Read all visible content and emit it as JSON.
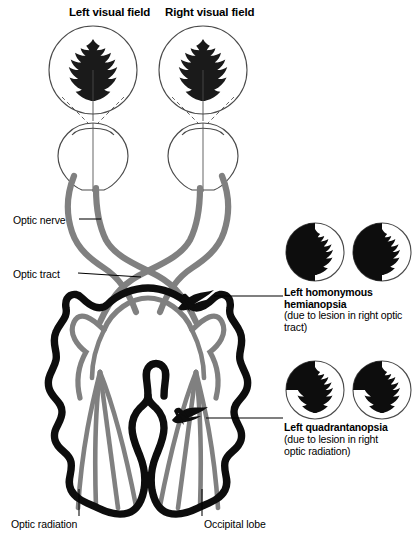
{
  "figure": {
    "colors": {
      "nerve_gray": "#808080",
      "brain_black": "#0d0d0d",
      "outline_gray": "#6f6f6f",
      "background": "#ffffff",
      "text": "#000000"
    }
  },
  "field_labels": {
    "left": "Left visual field",
    "right": "Right visual field"
  },
  "part_labels": {
    "optic_nerve": "Optic nerve",
    "optic_tract": "Optic tract",
    "optic_radiation": "Optic radiation",
    "occipital_lobe": "Occipital lobe"
  },
  "defects": [
    {
      "id": "hemianopsia",
      "title": "Left homonymous\nhemianopsia",
      "subtitle": "(due to lesion in right optic\ntract)",
      "pattern": "left-half-black",
      "circles": 2
    },
    {
      "id": "quadrantanopsia",
      "title": "Left quadrantanopsia",
      "subtitle": "(due to lesion in right\noptic radiation)",
      "pattern": "upper-left-quadrant-black",
      "circles": 2
    }
  ],
  "stimulus": {
    "shape": "oak-leaf",
    "fill": "#1a1a1a"
  },
  "lesion_markers": [
    {
      "id": "lesion-optic-tract",
      "x": 196,
      "y": 299
    },
    {
      "id": "lesion-optic-radiation",
      "x": 190,
      "y": 417
    }
  ]
}
